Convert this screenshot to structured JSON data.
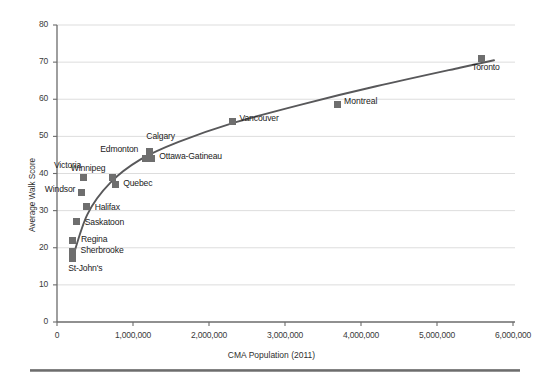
{
  "chart_data": {
    "type": "scatter",
    "title": "",
    "xlabel": "CMA Population (2011)",
    "ylabel": "Average Walk Score",
    "xlim": [
      0,
      6000000
    ],
    "ylim": [
      0,
      80
    ],
    "grid": true,
    "xticks": [
      "0",
      "1,000,000",
      "2,000,000",
      "3,000,000",
      "4,000,000",
      "5,000,000",
      "6,000,000"
    ],
    "xtick_values": [
      0,
      1000000,
      2000000,
      3000000,
      4000000,
      5000000,
      6000000
    ],
    "yticks": [
      "0",
      "10",
      "20",
      "30",
      "40",
      "50",
      "60",
      "70",
      "80"
    ],
    "ytick_values": [
      0,
      10,
      20,
      30,
      40,
      50,
      60,
      70,
      80
    ],
    "marker_color": "#6e6e6e",
    "trendline_color": "#58585a",
    "grid_color": "#d9d9d9",
    "axis_color": "#6b6b6b",
    "points": [
      {
        "label": "Toronto",
        "x": 5580000,
        "y": 71
      },
      {
        "label": "Vancouver",
        "x": 2310000,
        "y": 54
      },
      {
        "label": "Calgary",
        "x": 1215000,
        "y": 46
      },
      {
        "label": "Ottawa-Gatineau",
        "x": 1240000,
        "y": 44
      },
      {
        "label": "Edmonton",
        "x": 1160000,
        "y": 44
      },
      {
        "label": "Winnipeg",
        "x": 730000,
        "y": 39
      },
      {
        "label": "Quebec",
        "x": 765000,
        "y": 37
      },
      {
        "label": "Victoria",
        "x": 345000,
        "y": 39
      },
      {
        "label": "Windsor",
        "x": 320000,
        "y": 35
      },
      {
        "label": "Halifax",
        "x": 390000,
        "y": 31
      },
      {
        "label": "Saskatoon",
        "x": 260000,
        "y": 27
      },
      {
        "label": "Regina",
        "x": 210000,
        "y": 22
      },
      {
        "label": "Sherbrooke",
        "x": 205000,
        "y": 19
      },
      {
        "label": "St-John's",
        "x": 200000,
        "y": 17
      }
    ],
    "legend": {
      "position": "inside-right",
      "entries": [
        {
          "label": "Montreal",
          "color": "#6e6e6e"
        }
      ]
    },
    "trendline": {
      "description": "logarithmic best-fit curve rising from lower-left to upper-right",
      "points": [
        {
          "x": 195000,
          "y": 16.5
        },
        {
          "x": 400000,
          "y": 29.0
        },
        {
          "x": 700000,
          "y": 37.5
        },
        {
          "x": 1100000,
          "y": 43.8
        },
        {
          "x": 1600000,
          "y": 48.5
        },
        {
          "x": 2300000,
          "y": 53.5
        },
        {
          "x": 3200000,
          "y": 58.5
        },
        {
          "x": 4200000,
          "y": 63.5
        },
        {
          "x": 5300000,
          "y": 68.5
        },
        {
          "x": 5750000,
          "y": 70.5
        }
      ]
    }
  }
}
